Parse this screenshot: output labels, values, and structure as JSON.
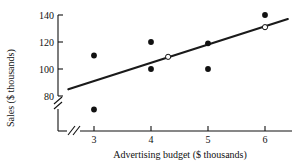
{
  "chart_data": {
    "type": "scatter",
    "title": "",
    "xlabel": "Advertising budget ($ thousands)",
    "ylabel": "Sales ($ thousands)",
    "xlim": [
      2.55,
      6.45
    ],
    "ylim": [
      62,
      145
    ],
    "xticks": [
      3,
      4,
      5,
      6
    ],
    "xtick_labels": [
      "3",
      "4",
      "5",
      "6"
    ],
    "yticks": [
      80,
      100,
      120,
      140
    ],
    "ytick_labels": [
      "80",
      "100",
      "120",
      "140"
    ],
    "grid": false,
    "legend": "none",
    "x_axis_break": true,
    "y_axis_break": true,
    "points": [
      {
        "x": 3,
        "y": 110,
        "style": "filled"
      },
      {
        "x": 3,
        "y": 70,
        "style": "filled"
      },
      {
        "x": 4,
        "y": 120,
        "style": "filled"
      },
      {
        "x": 4,
        "y": 100,
        "style": "filled"
      },
      {
        "x": 4.3,
        "y": 109,
        "style": "open"
      },
      {
        "x": 5,
        "y": 119,
        "style": "filled"
      },
      {
        "x": 5,
        "y": 100,
        "style": "filled"
      },
      {
        "x": 6,
        "y": 140,
        "style": "filled"
      },
      {
        "x": 6,
        "y": 131,
        "style": "open"
      }
    ],
    "fit_line": {
      "x_start": 2.55,
      "y_start": 85,
      "x_end": 6.4,
      "y_end": 137
    },
    "colors": {
      "axis": "#111111",
      "line": "#1a1a1a",
      "point_fill": "#111111",
      "point_open_fill": "#ffffff",
      "background": "#ffffff"
    }
  }
}
